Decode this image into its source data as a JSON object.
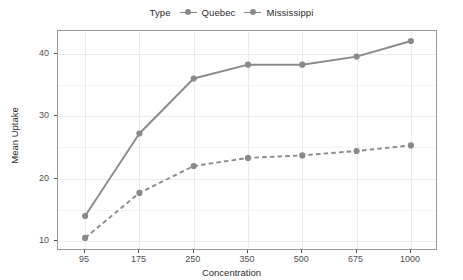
{
  "chart_data": {
    "type": "line",
    "title": "",
    "xlabel": "Concentration",
    "ylabel": "Mean Uptake",
    "categories": [
      "95",
      "175",
      "250",
      "350",
      "500",
      "675",
      "1000"
    ],
    "x": [
      95,
      175,
      250,
      350,
      500,
      675,
      1000
    ],
    "series": [
      {
        "name": "Quebec",
        "values": [
          14.0,
          27.2,
          36.0,
          38.2,
          38.2,
          39.5,
          42.0
        ],
        "linestyle": "solid",
        "color": "#8a8a8a"
      },
      {
        "name": "Mississippi",
        "values": [
          10.5,
          17.7,
          22.0,
          23.3,
          23.7,
          24.4,
          25.3
        ],
        "linestyle": "dashed",
        "color": "#8a8a8a"
      }
    ],
    "yticks": [
      10,
      20,
      30,
      40
    ],
    "ylim": [
      8.4,
      43.6
    ],
    "grid": true,
    "legend_position": "top",
    "legend_title": "Type"
  },
  "legend": {
    "title": "Type",
    "items": [
      {
        "label": "Quebec",
        "key": "point-line-key"
      },
      {
        "label": "Mississippi",
        "key": "point-line-key"
      }
    ]
  },
  "axes": {
    "x": {
      "title": "Concentration",
      "ticks": [
        "95",
        "175",
        "250",
        "350",
        "500",
        "675",
        "1000"
      ]
    },
    "y": {
      "title": "Mean Uptake",
      "ticks": [
        "40",
        "30",
        "20",
        "10"
      ]
    }
  },
  "colors": {
    "series": "#8a8a8a",
    "panel_background": "#ffffff",
    "panel_border": "#9a9a9a",
    "gridline_major": "#ebebeb",
    "gridline_minor": "#f4f4f4",
    "text": "#2b2b2b",
    "tick_text": "#4d4d4d"
  }
}
